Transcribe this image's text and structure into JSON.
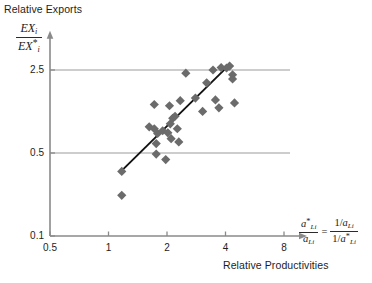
{
  "figure": {
    "axis_title_y": "Relative Exports",
    "axis_title_x": "Relative Productivities",
    "y_axis_formula": {
      "numerator": "EX",
      "numerator_sub": "i",
      "denominator": "EX",
      "denominator_sub": "i",
      "denominator_star": "*"
    },
    "x_axis_formula": {
      "left_num": "a",
      "left_num_star": "*",
      "left_num_sub": "Li",
      "left_den": "a",
      "left_den_sub": "Li",
      "equals": "=",
      "right_num_one": "1/",
      "right_num": "a",
      "right_num_sub": "Li",
      "right_den_one": "1/",
      "right_den": "a",
      "right_den_star": "*",
      "right_den_sub": "Li"
    }
  },
  "chart_data": {
    "type": "scatter",
    "title": "",
    "xlabel": "Relative Productivities",
    "ylabel": "Relative Exports",
    "xscale": "log",
    "yscale": "log",
    "xlim": [
      0.5,
      10
    ],
    "ylim": [
      0.1,
      4.0
    ],
    "xticks": [
      0.5,
      1,
      2,
      4,
      8
    ],
    "xticklabels": [
      "0.5",
      "1",
      "2",
      "4",
      "8"
    ],
    "yticks": [
      0.1,
      0.5,
      2.5
    ],
    "yticklabels": [
      "0.1",
      "0.5",
      "2.5"
    ],
    "gridlines": {
      "horizontal_at": [
        0.5,
        2.5
      ],
      "color": "#9b9b9b",
      "vertical_at": []
    },
    "marker": {
      "shape": "diamond",
      "color": "#6b6b6b",
      "size": 7
    },
    "points": [
      {
        "x": 1.17,
        "y": 0.35
      },
      {
        "x": 1.17,
        "y": 0.22
      },
      {
        "x": 1.76,
        "y": 0.6
      },
      {
        "x": 1.76,
        "y": 0.49
      },
      {
        "x": 1.97,
        "y": 0.44
      },
      {
        "x": 1.62,
        "y": 0.83
      },
      {
        "x": 1.72,
        "y": 0.8
      },
      {
        "x": 1.79,
        "y": 0.73
      },
      {
        "x": 1.9,
        "y": 0.77
      },
      {
        "x": 2.02,
        "y": 0.74
      },
      {
        "x": 2.08,
        "y": 0.88
      },
      {
        "x": 2.1,
        "y": 0.66
      },
      {
        "x": 2.14,
        "y": 0.98
      },
      {
        "x": 2.2,
        "y": 1.02
      },
      {
        "x": 2.26,
        "y": 0.8
      },
      {
        "x": 2.3,
        "y": 0.62
      },
      {
        "x": 2.06,
        "y": 1.25
      },
      {
        "x": 1.72,
        "y": 1.28
      },
      {
        "x": 2.34,
        "y": 1.38
      },
      {
        "x": 2.5,
        "y": 2.35
      },
      {
        "x": 2.8,
        "y": 1.45
      },
      {
        "x": 3.05,
        "y": 1.12
      },
      {
        "x": 3.2,
        "y": 1.95
      },
      {
        "x": 3.45,
        "y": 2.5
      },
      {
        "x": 3.55,
        "y": 1.4
      },
      {
        "x": 3.7,
        "y": 1.2
      },
      {
        "x": 3.8,
        "y": 2.62
      },
      {
        "x": 4.05,
        "y": 2.6
      },
      {
        "x": 4.2,
        "y": 2.7
      },
      {
        "x": 4.35,
        "y": 2.28
      },
      {
        "x": 4.45,
        "y": 1.32
      },
      {
        "x": 4.35,
        "y": 2.1
      }
    ],
    "fit_line": {
      "type": "linear-in-log-log",
      "from": {
        "x": 1.17,
        "y": 0.355
      },
      "to": {
        "x": 4.22,
        "y": 2.8
      },
      "color": "#111111"
    }
  }
}
